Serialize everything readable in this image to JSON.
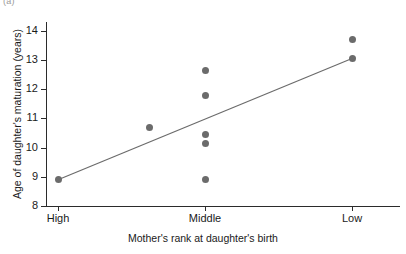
{
  "panel": {
    "label": "(a)"
  },
  "chart_data": {
    "type": "scatter",
    "title": "",
    "xlabel": "Mother's rank at daughter's birth",
    "ylabel": "Age of daughter's maturation (years)",
    "x_categories": [
      "High",
      "Middle",
      "Low"
    ],
    "x_tick_labels": [
      "High",
      "Middle",
      "Low"
    ],
    "y_tick_labels": [
      "14",
      "13",
      "12",
      "11",
      "10",
      "9",
      "8"
    ],
    "y_ticks": [
      14,
      13,
      12,
      11,
      10,
      9,
      8
    ],
    "ylim": [
      8,
      14.3
    ],
    "grid": false,
    "legend": null,
    "point_color": "#6b6b6b",
    "line_color": "#6b6b6b",
    "axis_color": "#2b2b2b",
    "points": [
      {
        "category": "High",
        "x": 1.0,
        "y": 8.9
      },
      {
        "category": "Middle",
        "x": 1.62,
        "y": 10.7
      },
      {
        "category": "Middle",
        "x": 2.0,
        "y": 12.65
      },
      {
        "category": "Middle",
        "x": 2.0,
        "y": 11.8
      },
      {
        "category": "Middle",
        "x": 2.0,
        "y": 10.45
      },
      {
        "category": "Middle",
        "x": 2.0,
        "y": 10.15
      },
      {
        "category": "Middle",
        "x": 2.0,
        "y": 8.9
      },
      {
        "category": "Low",
        "x": 3.0,
        "y": 13.7
      },
      {
        "category": "Low",
        "x": 3.0,
        "y": 13.05
      }
    ],
    "trend_line": {
      "x_start": 1.0,
      "y_start": 8.9,
      "x_end": 3.0,
      "y_end": 13.05
    }
  }
}
